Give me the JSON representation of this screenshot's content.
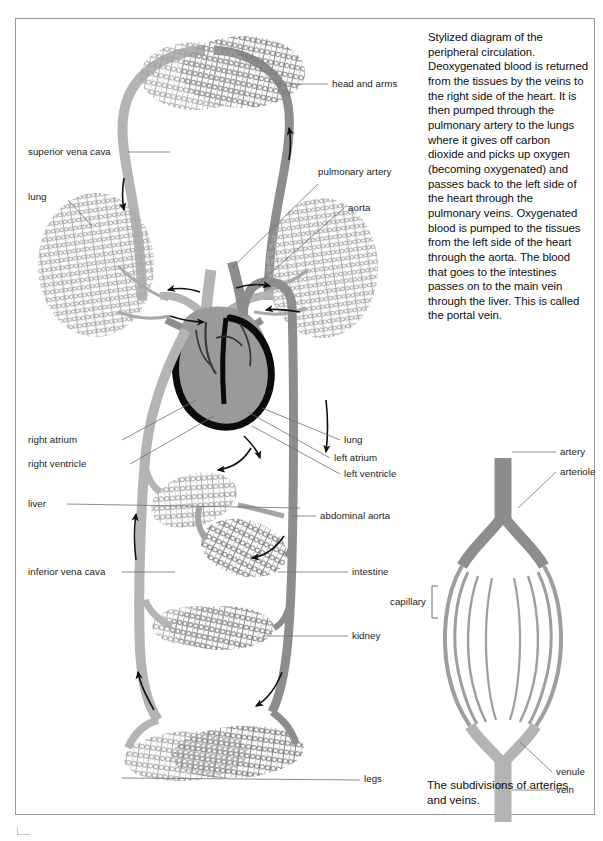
{
  "figure": {
    "caption_main": "Stylized diagram of the peripheral circulation. Deoxygenated blood is returned from the tissues by the veins to the right side of the heart. It is then pumped through the pulmonary artery to the lungs where it gives off carbon dioxide and picks up oxygen (becoming oxygenated) and passes back to the left side of the heart through the pulmonary veins. Oxygenated blood is pumped to the tissues from the left side of the heart through the aorta. The blood that goes to the intestines passes on to the main vein through the liver. This is called the portal vein.",
    "caption_inset": "The subdivisions of arteries and veins."
  },
  "colors": {
    "artery": "#8d8d8d",
    "vein": "#b4b4b4",
    "heart_fill": "#9a9a9a",
    "heart_outline": "#0b0b0b",
    "capillary": "#a5a5a5",
    "capillary_dark": "#838383",
    "frame": "#9a9a9a",
    "arrow": "#101010",
    "leader": "#6f6f6f",
    "text": "#0d0d0d"
  },
  "main_diagram": {
    "labels_left": [
      {
        "id": "superior-vena-cava",
        "text": "superior vena cava"
      },
      {
        "id": "lung-left",
        "text": "lung"
      },
      {
        "id": "right-atrium",
        "text": "right atrium"
      },
      {
        "id": "right-ventricle",
        "text": "right ventricle"
      },
      {
        "id": "liver",
        "text": "liver"
      },
      {
        "id": "inferior-vena-cava",
        "text": "inferior vena cava"
      }
    ],
    "labels_right": [
      {
        "id": "head-and-arms",
        "text": "head and arms"
      },
      {
        "id": "pulmonary-artery",
        "text": "pulmonary artery"
      },
      {
        "id": "aorta",
        "text": "aorta"
      },
      {
        "id": "lung-right",
        "text": "lung"
      },
      {
        "id": "left-atrium",
        "text": "left atrium"
      },
      {
        "id": "left-ventricle",
        "text": "left ventricle"
      },
      {
        "id": "abdominal-aorta",
        "text": "abdominal aorta"
      },
      {
        "id": "intestine",
        "text": "intestine"
      },
      {
        "id": "kidney",
        "text": "kidney"
      },
      {
        "id": "legs",
        "text": "legs"
      }
    ]
  },
  "inset_diagram": {
    "labels": [
      {
        "id": "artery",
        "text": "artery"
      },
      {
        "id": "arteriole",
        "text": "arteriole"
      },
      {
        "id": "capillary",
        "text": "capillary"
      },
      {
        "id": "venule",
        "text": "venule"
      },
      {
        "id": "vein",
        "text": "vein"
      }
    ]
  }
}
